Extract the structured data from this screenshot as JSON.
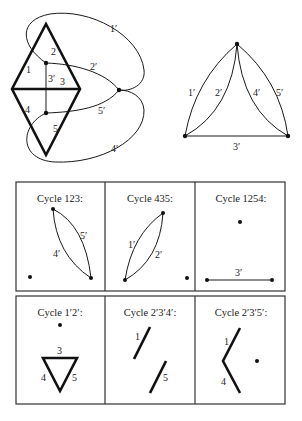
{
  "figure": {
    "primal_graph": {
      "face_labels": [
        "1",
        "2",
        "3",
        "3′",
        "4",
        "5"
      ],
      "dual_edge_labels": [
        "1′",
        "2′",
        "5′",
        "4′"
      ]
    },
    "dual_graph": {
      "edge_labels": [
        "1′",
        "2′",
        "3′",
        "4′",
        "5′"
      ]
    },
    "panels_row1": [
      {
        "title": "Cycle 123:",
        "edge_labels": [
          "4′",
          "5′"
        ]
      },
      {
        "title": "Cycle 435:",
        "edge_labels": [
          "1′",
          "2′"
        ]
      },
      {
        "title": "Cycle 1254:",
        "edge_labels": [
          "3′"
        ]
      }
    ],
    "panels_row2": [
      {
        "title": "Cycle 1′2′:",
        "edge_labels": [
          "3",
          "4",
          "5"
        ]
      },
      {
        "title": "Cycle 2′3′4′:",
        "edge_labels": [
          "1",
          "5"
        ]
      },
      {
        "title": "Cycle 2′3′5′:",
        "edge_labels": [
          "1",
          "4"
        ]
      }
    ]
  }
}
